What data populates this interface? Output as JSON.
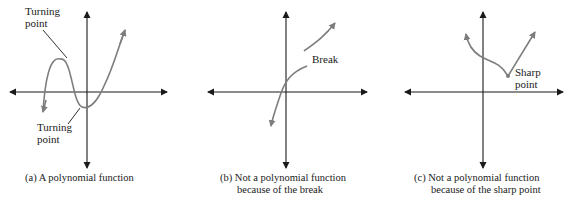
{
  "colors": {
    "axis": "#1a1a1a",
    "curve": "#7d7d7d",
    "text": "#1a1a1a"
  },
  "panels": [
    {
      "id": "a",
      "caption_lines": [
        "(a) A polynomial function"
      ],
      "annotations": [
        {
          "text_lines": [
            "Turning",
            "point"
          ],
          "position": "upper-left"
        },
        {
          "text_lines": [
            "Turning",
            "point"
          ],
          "position": "lower"
        }
      ]
    },
    {
      "id": "b",
      "caption_lines": [
        "(b) Not a polynomial function",
        "because of the break"
      ],
      "annotations": [
        {
          "text_lines": [
            "Break"
          ]
        }
      ]
    },
    {
      "id": "c",
      "caption_lines": [
        "(c) Not a polynomial function",
        "because of the sharp point"
      ],
      "annotations": [
        {
          "text_lines": [
            "Sharp",
            "point"
          ]
        }
      ]
    }
  ]
}
